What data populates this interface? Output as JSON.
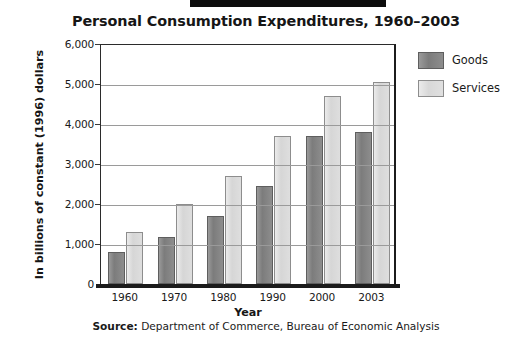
{
  "chart_data": {
    "type": "bar",
    "title": "Personal Consumption Expenditures, 1960–2003",
    "xlabel": "Year",
    "ylabel": "In billions of constant (1996) dollars",
    "categories": [
      "1960",
      "1970",
      "1980",
      "1990",
      "2000",
      "2003"
    ],
    "series": [
      {
        "name": "Goods",
        "color": "#7c7c7c",
        "values": [
          800,
          1175,
          1700,
          2450,
          3700,
          3800
        ]
      },
      {
        "name": "Services",
        "color": "#d8d8d8",
        "values": [
          1300,
          2000,
          2700,
          3700,
          4700,
          5050
        ]
      }
    ],
    "ylim": [
      0,
      6000
    ],
    "yticks": [
      0,
      1000,
      2000,
      3000,
      4000,
      5000,
      6000
    ],
    "ytick_labels": [
      "0",
      "1,000",
      "2,000",
      "3,000",
      "4,000",
      "5,000",
      "6,000"
    ],
    "grid": true,
    "legend_position": "right"
  },
  "source": {
    "prefix": "Source:",
    "text": " Department of Commerce, Bureau of Economic Analysis"
  }
}
